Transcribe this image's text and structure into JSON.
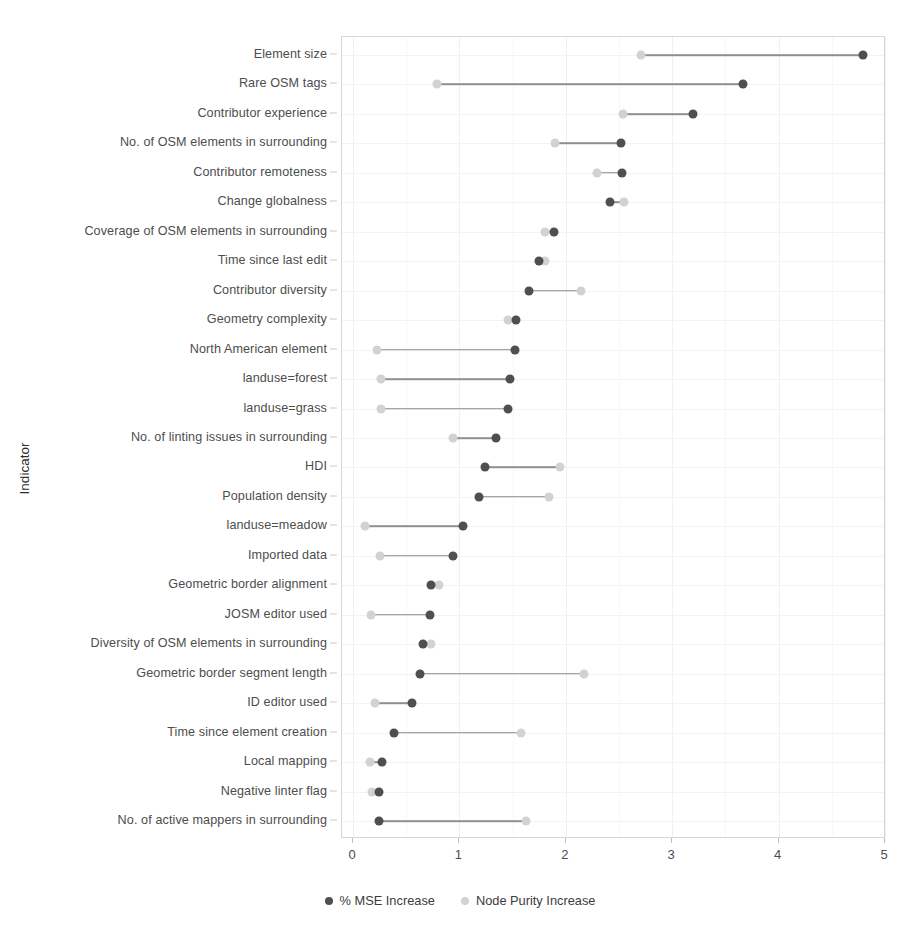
{
  "chart_data": {
    "type": "scatter",
    "title": "",
    "xlabel": "",
    "ylabel": "Indicator",
    "xlim": [
      0,
      5
    ],
    "ylim_categories": 27,
    "grid": true,
    "legend_position": "bottom",
    "x_ticks": [
      "0",
      "1",
      "2",
      "3",
      "4",
      "5"
    ],
    "x_tick_values": [
      0,
      1,
      2,
      3,
      4,
      5
    ],
    "x_minor_ticks": [
      0.5,
      1.5,
      2.5,
      3.5,
      4.5
    ],
    "series": [
      {
        "name": "% MSE Increase",
        "key": "mse",
        "color": "#4f4f4f",
        "values": [
          4.79,
          3.67,
          3.2,
          2.52,
          2.53,
          2.42,
          1.89,
          1.75,
          1.65,
          1.53,
          1.52,
          1.48,
          1.46,
          1.34,
          1.24,
          1.18,
          1.03,
          0.94,
          0.73,
          0.72,
          0.66,
          0.63,
          0.55,
          0.39,
          0.27,
          0.24,
          0.24
        ]
      },
      {
        "name": "Node Purity Increase",
        "key": "np",
        "color": "#d2d2d2",
        "values": [
          2.71,
          0.79,
          2.54,
          1.9,
          2.29,
          2.55,
          1.8,
          1.8,
          2.14,
          1.46,
          0.23,
          0.26,
          0.26,
          0.94,
          1.95,
          1.84,
          0.11,
          0.25,
          0.81,
          0.17,
          0.73,
          2.17,
          0.21,
          1.58,
          0.16,
          0.18,
          1.63
        ]
      }
    ],
    "categories": [
      "Element size",
      "Rare OSM tags",
      "Contributor experience",
      "No. of OSM elements in surrounding",
      "Contributor remoteness",
      "Change globalness",
      "Coverage of OSM elements in surrounding",
      "Time since last edit",
      "Contributor diversity",
      "Geometry complexity",
      "North American element",
      "landuse=forest",
      "landuse=grass",
      "No. of linting issues in surrounding",
      "HDI",
      "Population density",
      "landuse=meadow",
      "Imported data",
      "Geometric border alignment",
      "JOSM editor used",
      "Diversity of OSM elements in surrounding",
      "Geometric border segment length",
      "ID editor used",
      "Time since element creation",
      "Local mapping",
      "Negative linter flag",
      "No. of active mappers in surrounding"
    ]
  },
  "legend": {
    "items": [
      {
        "label": "% MSE Increase",
        "key": "mse"
      },
      {
        "label": "Node Purity Increase",
        "key": "np"
      }
    ]
  },
  "axis": {
    "y_title": "Indicator"
  }
}
